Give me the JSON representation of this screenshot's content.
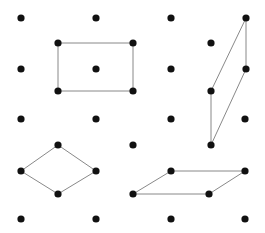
{
  "diagram": {
    "title": "",
    "colors": {
      "dot": "#111111",
      "edge": "#7a7a7a",
      "background": "#ffffff"
    },
    "dot_radius": 3.6,
    "edge_width": 0.9,
    "dots": [
      [
        21,
        18
      ],
      [
        96,
        18
      ],
      [
        171,
        18
      ],
      [
        246,
        18
      ],
      [
        58,
        43
      ],
      [
        133,
        43
      ],
      [
        211,
        43
      ],
      [
        21,
        69
      ],
      [
        96,
        69
      ],
      [
        171,
        69
      ],
      [
        246,
        69
      ],
      [
        58,
        91
      ],
      [
        133,
        91
      ],
      [
        211,
        91
      ],
      [
        21,
        119
      ],
      [
        96,
        119
      ],
      [
        171,
        119
      ],
      [
        245,
        119
      ],
      [
        58,
        145
      ],
      [
        133,
        145
      ],
      [
        211,
        145
      ],
      [
        21,
        171
      ],
      [
        96,
        171
      ],
      [
        171,
        171
      ],
      [
        245,
        171
      ],
      [
        58,
        194
      ],
      [
        133,
        194
      ],
      [
        209,
        194
      ],
      [
        21,
        219
      ],
      [
        96,
        219
      ],
      [
        171,
        219
      ],
      [
        245,
        219
      ]
    ],
    "shapes": [
      {
        "name": "rectangle",
        "points": [
          [
            58,
            43
          ],
          [
            133,
            43
          ],
          [
            133,
            91
          ],
          [
            58,
            91
          ]
        ]
      },
      {
        "name": "tall-parallelogram",
        "points": [
          [
            246,
            18
          ],
          [
            246,
            69
          ],
          [
            211,
            145
          ],
          [
            211,
            91
          ]
        ]
      },
      {
        "name": "rhombus",
        "points": [
          [
            58,
            145
          ],
          [
            96,
            171
          ],
          [
            58,
            194
          ],
          [
            21,
            171
          ]
        ]
      },
      {
        "name": "flat-parallelogram",
        "points": [
          [
            171,
            171
          ],
          [
            245,
            171
          ],
          [
            209,
            194
          ],
          [
            133,
            194
          ]
        ]
      }
    ]
  }
}
